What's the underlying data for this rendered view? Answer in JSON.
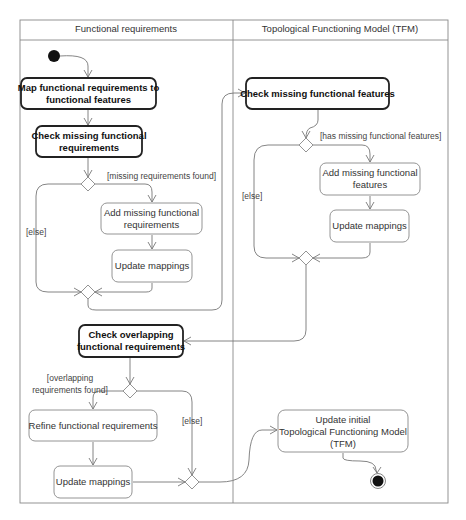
{
  "diagram": {
    "type": "UML activity diagram",
    "lanes": [
      {
        "id": "fr",
        "title": "Functional requirements"
      },
      {
        "id": "tfm",
        "title": "Topological Functioning Model (TFM)"
      }
    ],
    "nodes": {
      "map_fr": {
        "lines": [
          "Map functional requirements to",
          "functional features"
        ],
        "bold": true
      },
      "check_missing_fr": {
        "lines": [
          "Check missing functional",
          "requirements"
        ],
        "bold": true
      },
      "add_missing_fr": {
        "lines": [
          "Add missing functional",
          "requirements"
        ],
        "bold": false
      },
      "update_map_1": {
        "lines": [
          "Update mappings"
        ],
        "bold": false
      },
      "check_missing_ff": {
        "lines": [
          "Check missing functional  features"
        ],
        "bold": true
      },
      "add_missing_ff": {
        "lines": [
          "Add missing functional",
          "features"
        ],
        "bold": false
      },
      "update_map_2": {
        "lines": [
          "Update mappings"
        ],
        "bold": false
      },
      "check_overlap_fr": {
        "lines": [
          "Check overlapping",
          "functional requirements"
        ],
        "bold": true
      },
      "refine_fr": {
        "lines": [
          "Refine functional requirements"
        ],
        "bold": false
      },
      "update_map_3": {
        "lines": [
          "Update mappings"
        ],
        "bold": false
      },
      "update_tfm": {
        "lines": [
          "Update initial",
          "Topological Functioning Model",
          "(TFM)"
        ],
        "bold": false
      }
    },
    "guards": {
      "missing_req_found": "[missing requirements found]",
      "else_1": "[else]",
      "has_missing_ff": "[has missing functional features]",
      "else_2": "[else]",
      "overlap_found_1": "[overlapping",
      "overlap_found_2": "requirements found]",
      "else_3": "[else]"
    }
  }
}
